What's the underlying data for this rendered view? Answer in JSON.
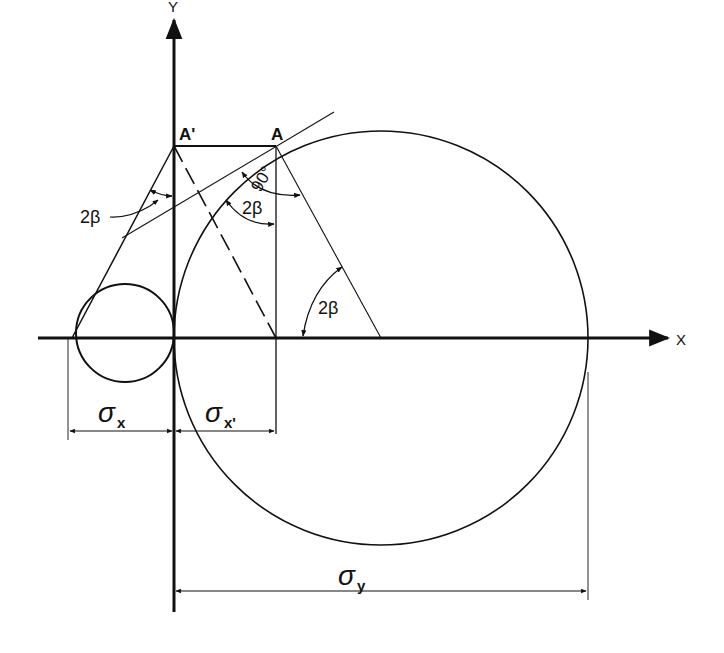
{
  "diagram": {
    "axes": {
      "x_label": "X",
      "y_label": "Y"
    },
    "points": {
      "a_prime": "A'",
      "a": "A"
    },
    "angles": {
      "left_angle": "2β",
      "right_angle_mark": "90°",
      "mid_angle": "2β",
      "lower_angle": "2β"
    },
    "dimensions": {
      "sigma_x": "σ",
      "sigma_x_sub": "x",
      "sigma_x_prime": "σ",
      "sigma_x_prime_sub": "x'",
      "sigma_y": "σ",
      "sigma_y_sub": "y"
    }
  }
}
